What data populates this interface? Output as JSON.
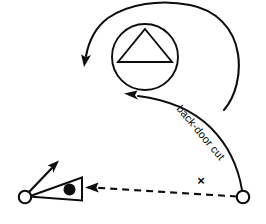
{
  "diagram": {
    "type": "basketball-play-diagram",
    "background_color": "#ffffff",
    "ink_color": "#0d0d0d",
    "annotations": {
      "cut_label": "back-door cut",
      "defender_mark": "×"
    },
    "elements": [
      {
        "name": "basket-circle-with-triangle",
        "role": "hoop-marker",
        "center_x": 145,
        "center_y": 57,
        "radius": 33
      },
      {
        "name": "triangle-inside-circle",
        "role": "direction-marker",
        "apex_x": 145,
        "apex_y": 29,
        "base_left_x": 118,
        "base_left_y": 62,
        "base_right_x": 172,
        "base_right_y": 62
      },
      {
        "name": "sweep-motion-arc",
        "role": "movement-path",
        "arrow_tip_x": 85,
        "arrow_tip_y": 63
      },
      {
        "name": "back-door-cut-path",
        "role": "cut-path",
        "arrow_tip_x": 125,
        "arrow_tip_y": 95
      },
      {
        "name": "pass-dashed-line",
        "role": "pass-path",
        "from_x": 243,
        "from_y": 197,
        "to_x": 88,
        "to_y": 188
      },
      {
        "name": "ball-handler-node",
        "role": "offensive-player-with-ball",
        "center_x": 25,
        "center_y": 197,
        "radius": 6
      },
      {
        "name": "passer-node",
        "role": "offensive-player",
        "center_x": 243,
        "center_y": 197,
        "radius": 6
      },
      {
        "name": "screen-cone",
        "role": "screen-marker",
        "ball_dot_x": 70,
        "ball_dot_y": 190
      },
      {
        "name": "player-move-arrow",
        "role": "movement-arrow",
        "tip_x": 58,
        "tip_y": 162
      }
    ]
  }
}
